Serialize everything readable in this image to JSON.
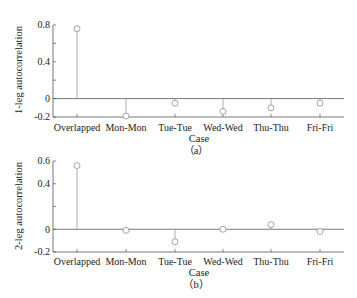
{
  "chart_data": [
    {
      "type": "stem",
      "panel_label": "（a）",
      "xlabel": "Case",
      "ylabel": "1-leg autocorrelation",
      "categories": [
        "Overlapped",
        "Mon-Mon",
        "Tue-Tue",
        "Wed-Wed",
        "Thu-Thu",
        "Fri-Fri"
      ],
      "values": [
        0.76,
        -0.19,
        -0.05,
        -0.14,
        -0.1,
        -0.05
      ],
      "ylim": [
        -0.2,
        0.8
      ],
      "yticks": [
        "0.8",
        "0.4",
        "0",
        "-0.2"
      ],
      "grid": false
    },
    {
      "type": "stem",
      "panel_label": "（b）",
      "xlabel": "Case",
      "ylabel": "2-leg autocorrelation",
      "categories": [
        "Overlapped",
        "Mon-Mon",
        "Tue-Tue",
        "Wed-Wed",
        "Thu-Thu",
        "Fri-Fri"
      ],
      "values": [
        0.56,
        -0.01,
        -0.11,
        0.0,
        0.04,
        -0.02
      ],
      "ylim": [
        -0.2,
        0.6
      ],
      "yticks": [
        "0.6",
        "0.4",
        "0",
        "-0.2"
      ],
      "grid": false
    }
  ],
  "colors": {
    "axis": "#555555",
    "stem": "#9a9a9a",
    "marker": "#9a9a9a",
    "text": "#222222"
  }
}
